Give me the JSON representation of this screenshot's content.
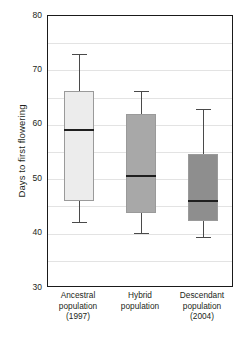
{
  "chart_data": {
    "type": "box",
    "title": "",
    "xlabel": "",
    "ylabel": "Days to first flowering",
    "ylim": [
      30,
      80
    ],
    "yticks": [
      30,
      40,
      50,
      60,
      70,
      80
    ],
    "gridlines": [
      35,
      40,
      45,
      50,
      55,
      60,
      65,
      70,
      75
    ],
    "grid": true,
    "legend": "none",
    "categories": [
      "Ancestral population (1997)",
      "Hybrid population",
      "Descendant population (2004)"
    ],
    "category_lines": [
      [
        "Ancestral",
        "population",
        "(1997)"
      ],
      [
        "Hybrid",
        "population"
      ],
      [
        "Descendant",
        "population",
        "(2004)"
      ]
    ],
    "boxes": [
      {
        "name": "Ancestral population (1997)",
        "whisker_high": 73.1,
        "q3": 66.3,
        "median": 59.0,
        "q1": 46.0,
        "whisker_low": 42.2,
        "fill": "#ececec"
      },
      {
        "name": "Hybrid population",
        "whisker_high": 66.2,
        "q3": 62.0,
        "median": 50.6,
        "q1": 43.8,
        "whisker_low": 40.1,
        "fill": "#a8a8a8"
      },
      {
        "name": "Descendant population (2004)",
        "whisker_high": 62.9,
        "q3": 54.6,
        "median": 46.0,
        "q1": 42.3,
        "whisker_low": 39.4,
        "fill": "#8e8e8e"
      }
    ]
  },
  "axis": {
    "ylabel_text": "Days to first flowering",
    "ytick_labels": [
      "80",
      "70",
      "60",
      "50",
      "40",
      "30"
    ]
  },
  "colors": {
    "axis": "#1a1a1a",
    "grid": "#e3e3e3",
    "median": "#1f1f1f",
    "whisker": "#4a4a4a",
    "box_border": "#9a9a9a",
    "text": "#231f20"
  }
}
